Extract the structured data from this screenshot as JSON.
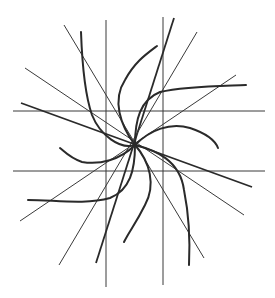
{
  "diagram": {
    "center": [
      135,
      145
    ],
    "stroke_color": "#2a2a2a",
    "background": "#ffffff",
    "straight_lines": [
      {
        "name": "horizontal-upper",
        "x1": 13,
        "y1": 111,
        "x2": 265,
        "y2": 111
      },
      {
        "name": "horizontal-lower",
        "x1": 13,
        "y1": 171,
        "x2": 265,
        "y2": 171
      },
      {
        "name": "vertical-left",
        "x1": 106,
        "y1": 20,
        "x2": 106,
        "y2": 287
      },
      {
        "name": "vertical-right",
        "x1": 163,
        "y1": 17,
        "x2": 163,
        "y2": 285
      },
      {
        "name": "diag-ne-thick",
        "x1": 174,
        "y1": 18,
        "x2": 96,
        "y2": 263
      },
      {
        "name": "diag-ne-mid",
        "x1": 197,
        "y1": 32,
        "x2": 59,
        "y2": 265
      },
      {
        "name": "diag-ne-outer",
        "x1": 236,
        "y1": 75,
        "x2": 20,
        "y2": 221
      },
      {
        "name": "diag-nw-inner",
        "x1": 64,
        "y1": 25,
        "x2": 204,
        "y2": 258
      },
      {
        "name": "diag-nw-mid",
        "x1": 25,
        "y1": 68,
        "x2": 244,
        "y2": 215
      },
      {
        "name": "diag-nw-thick",
        "x1": 21,
        "y1": 103,
        "x2": 252,
        "y2": 187
      }
    ],
    "curves": [
      {
        "name": "arm-top-left",
        "d": "M135,145 C120,150 100,135 92,115 C85,95 82,60 81,32"
      },
      {
        "name": "arm-top",
        "d": "M135,145 C120,125 112,100 125,80 C135,62 145,55 157,46"
      },
      {
        "name": "arm-right-top",
        "d": "M135,145 C135,120 140,100 160,92 C185,86 220,86 246,85"
      },
      {
        "name": "arm-right",
        "d": "M135,145 C150,130 170,122 190,128 C205,133 215,140 218,148"
      },
      {
        "name": "arm-bottom-right",
        "d": "M135,145 C155,150 180,160 184,190 C189,215 190,245 189,265"
      },
      {
        "name": "arm-bottom",
        "d": "M135,145 C150,162 156,185 145,205 C135,225 130,230 124,242"
      },
      {
        "name": "arm-bottom-left",
        "d": "M135,145 C135,170 130,190 110,198 C85,205 55,200 28,200"
      },
      {
        "name": "arm-left",
        "d": "M135,145 C120,160 100,165 82,162 C70,158 65,152 60,148"
      }
    ]
  }
}
